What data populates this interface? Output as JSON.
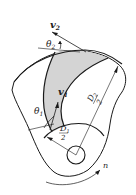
{
  "diagram": {
    "labels": {
      "v2": "v",
      "v2_sub": "2",
      "theta2": "θ",
      "theta2_sub": "2",
      "v1": "v",
      "v1_sub": "1",
      "theta1": "θ",
      "theta1_sub": "1",
      "D1_num": "D",
      "D1_sub": "1",
      "D1_den": "2",
      "D2_num": "D",
      "D2_sub": "2",
      "D2_den": "2",
      "rotation": "n"
    },
    "colors": {
      "stroke": "#1a1a1a",
      "passage_fill": "#d4d4d4",
      "background": "#ffffff"
    }
  }
}
